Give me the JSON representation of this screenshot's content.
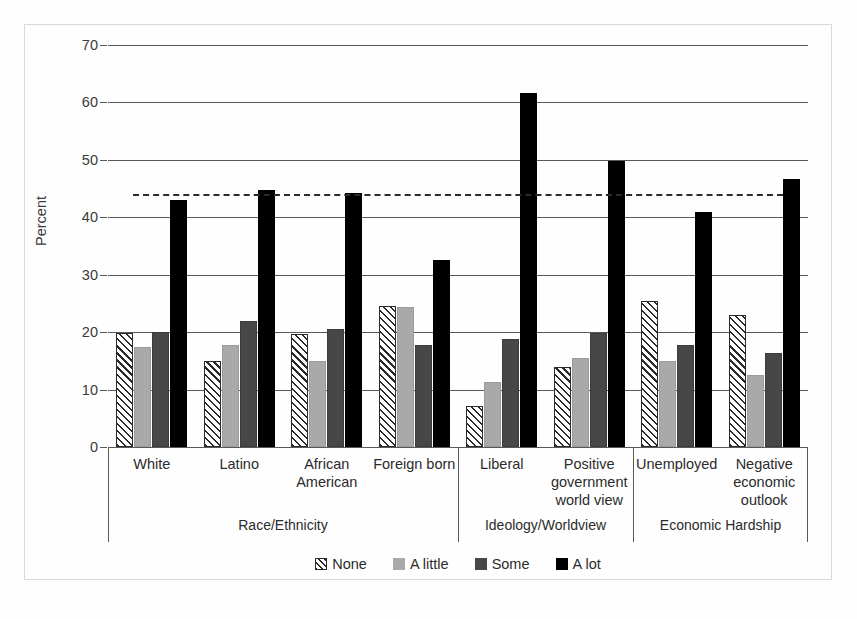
{
  "chart_data": {
    "type": "bar",
    "title": "",
    "subtitle": "",
    "xlabel": "",
    "ylabel": "Percent",
    "ylim": [
      0,
      70
    ],
    "yticks": [
      0,
      10,
      20,
      30,
      40,
      50,
      60,
      70
    ],
    "ytick_labels": [
      "0",
      "10",
      "20",
      "30",
      "40",
      "50",
      "60",
      "70"
    ],
    "grid": true,
    "legend_position": "bottom",
    "categories": [
      "White",
      "Latino",
      "African American",
      "Foreign born",
      "Liberal",
      "Positive government world view",
      "Unemployed",
      "Negative economic outlook"
    ],
    "category_label_lines": [
      [
        "White"
      ],
      [
        "Latino"
      ],
      [
        "African",
        "American"
      ],
      [
        "Foreign born"
      ],
      [
        "Liberal"
      ],
      [
        "Positive",
        "government",
        "world view"
      ],
      [
        "Unemployed"
      ],
      [
        "Negative",
        "economic",
        "outlook"
      ]
    ],
    "groups": [
      {
        "label": "Race/Ethnicity",
        "categories": [
          "White",
          "Latino",
          "African American",
          "Foreign born"
        ]
      },
      {
        "label": "Ideology/Worldview",
        "categories": [
          "Liberal",
          "Positive government world view"
        ]
      },
      {
        "label": "Economic Hardship",
        "categories": [
          "Unemployed",
          "Negative economic outlook"
        ]
      }
    ],
    "series": [
      {
        "name": "None",
        "pattern": "diagonal-hatch",
        "color": "#ffffff",
        "values": [
          19.8,
          15.0,
          19.6,
          24.5,
          7.2,
          14.0,
          25.5,
          23.0
        ]
      },
      {
        "name": "A little",
        "pattern": "solid",
        "color": "#a9a9a9",
        "values": [
          17.5,
          17.8,
          15.0,
          24.4,
          11.3,
          15.5,
          15.0,
          12.5
        ]
      },
      {
        "name": "Some",
        "pattern": "solid",
        "color": "#474747",
        "values": [
          20.1,
          22.0,
          20.5,
          17.8,
          18.8,
          19.8,
          17.8,
          16.3
        ]
      },
      {
        "name": "A lot",
        "pattern": "solid",
        "color": "#000000",
        "values": [
          43.0,
          44.8,
          44.2,
          32.5,
          61.6,
          49.8,
          41.0,
          46.7
        ]
      }
    ],
    "reference_line": {
      "value": 44.0,
      "style": "dashed",
      "color": "#2b2b2b"
    },
    "annotations": []
  },
  "legend": {
    "items": [
      {
        "label": "None",
        "swatch": "none"
      },
      {
        "label": "A little",
        "swatch": "little"
      },
      {
        "label": "Some",
        "swatch": "some"
      },
      {
        "label": "A lot",
        "swatch": "alot"
      }
    ]
  }
}
